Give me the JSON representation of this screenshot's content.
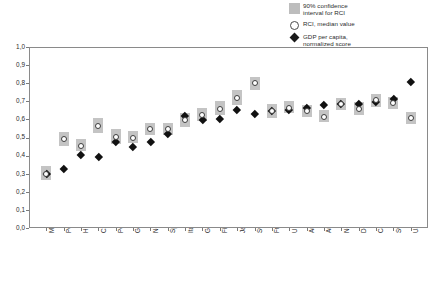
{
  "legend": {
    "items": [
      {
        "marker": "confidence-band-swatch",
        "label": "90% confidence\ninterval for RCI"
      },
      {
        "marker": "median-circle",
        "label": "RCI, median value"
      },
      {
        "marker": "gdp-diamond",
        "label": "GDP per capita,\nnormalized score"
      }
    ]
  },
  "axes": {
    "y_ticks": [
      "1,0",
      "0,9",
      "0,8",
      "0,7",
      "0,6",
      "0,5",
      "0,4",
      "0,3",
      "0,2",
      "0,1",
      "0,0"
    ],
    "y_min": 0.0,
    "y_max": 1.0
  },
  "colors": {
    "band": "#c4c4c4",
    "median_outline": "#3d3d3d",
    "gdp": "#111111",
    "axis": "#8a8a8a",
    "text": "#2b2b2b"
  },
  "chart_data": {
    "type": "scatter",
    "title": "",
    "subtitle": "",
    "xlabel": "",
    "ylabel": "",
    "ylim": [
      0.0,
      1.0
    ],
    "grid": false,
    "legend_position": "top-right",
    "categories": [
      "Mexico",
      "Poland",
      "Hungary",
      "Czech Rep.",
      "Portugal",
      "Greece",
      "New Zealand",
      "Spain",
      "Italy",
      "Germany",
      "Finland",
      "Japan",
      "Sweden",
      "France",
      "UK",
      "Australia",
      "Austria",
      "Netherlands",
      "Denmark",
      "Canada",
      "Switzerland",
      "USA"
    ],
    "series": [
      {
        "name": "RCI, median value",
        "type": "point",
        "values": [
          0.3,
          0.49,
          0.455,
          0.565,
          0.505,
          0.5,
          0.545,
          0.545,
          0.595,
          0.625,
          0.66,
          0.72,
          0.8,
          0.645,
          0.665,
          0.645,
          0.615,
          0.685,
          0.66,
          0.705,
          0.69,
          0.605
        ]
      },
      {
        "name": "90% confidence interval for RCI",
        "type": "interval",
        "lower": [
          0.265,
          0.455,
          0.425,
          0.525,
          0.465,
          0.47,
          0.515,
          0.515,
          0.56,
          0.59,
          0.625,
          0.68,
          0.765,
          0.61,
          0.635,
          0.615,
          0.585,
          0.65,
          0.625,
          0.67,
          0.655,
          0.575
        ],
        "upper": [
          0.345,
          0.53,
          0.49,
          0.605,
          0.545,
          0.535,
          0.58,
          0.58,
          0.635,
          0.665,
          0.7,
          0.76,
          0.835,
          0.685,
          0.7,
          0.68,
          0.65,
          0.72,
          0.695,
          0.74,
          0.725,
          0.64
        ]
      },
      {
        "name": "GDP per capita, normalized score",
        "type": "point",
        "values": [
          0.3,
          0.325,
          0.405,
          0.395,
          0.475,
          0.45,
          0.475,
          0.52,
          0.62,
          0.6,
          0.605,
          0.655,
          0.63,
          0.645,
          0.655,
          0.665,
          0.68,
          0.685,
          0.685,
          0.7,
          0.715,
          0.805
        ]
      }
    ]
  }
}
